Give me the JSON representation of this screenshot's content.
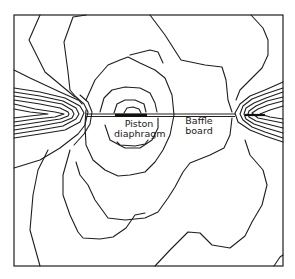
{
  "figure": {
    "type": "contour-plot",
    "labels": {
      "piston": [
        "Piston",
        "diaphragm"
      ],
      "baffle": [
        "Baffle",
        "board"
      ]
    },
    "colors": {
      "stroke": "#1e1e1e",
      "background": "#ffffff"
    }
  }
}
